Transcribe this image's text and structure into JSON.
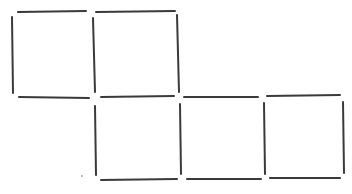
{
  "diagram": {
    "type": "matchstick-puzzle",
    "stick_color": "#3a3a3a",
    "stick_thickness": 2,
    "squares": [
      {
        "row": 0,
        "col": 0
      },
      {
        "row": 0,
        "col": 1
      },
      {
        "row": 1,
        "col": 1
      },
      {
        "row": 1,
        "col": 2
      },
      {
        "row": 1,
        "col": 3
      }
    ],
    "sticks": [
      {
        "id": "h-top-1",
        "x1": 18,
        "y1": 12,
        "x2": 86,
        "y2": 11
      },
      {
        "id": "h-top-2",
        "x1": 96,
        "y1": 12,
        "x2": 175,
        "y2": 11
      },
      {
        "id": "v-left-1",
        "x1": 12,
        "y1": 17,
        "x2": 13,
        "y2": 93
      },
      {
        "id": "v-mid-1",
        "x1": 93,
        "y1": 18,
        "x2": 95,
        "y2": 92
      },
      {
        "id": "v-right-2",
        "x1": 177,
        "y1": 15,
        "x2": 179,
        "y2": 92
      },
      {
        "id": "h-mid-1",
        "x1": 19,
        "y1": 97,
        "x2": 89,
        "y2": 98
      },
      {
        "id": "h-mid-2",
        "x1": 101,
        "y1": 97,
        "x2": 174,
        "y2": 96
      },
      {
        "id": "h-mid-3",
        "x1": 184,
        "y1": 97,
        "x2": 258,
        "y2": 97
      },
      {
        "id": "h-mid-4",
        "x1": 267,
        "y1": 96,
        "x2": 340,
        "y2": 95
      },
      {
        "id": "v-b-1",
        "x1": 95,
        "y1": 106,
        "x2": 96,
        "y2": 175
      },
      {
        "id": "v-b-2",
        "x1": 180,
        "y1": 104,
        "x2": 181,
        "y2": 174
      },
      {
        "id": "v-b-3",
        "x1": 264,
        "y1": 103,
        "x2": 265,
        "y2": 174
      },
      {
        "id": "v-b-4",
        "x1": 343,
        "y1": 102,
        "x2": 344,
        "y2": 173
      },
      {
        "id": "h-bot-1",
        "x1": 101,
        "y1": 180,
        "x2": 177,
        "y2": 179
      },
      {
        "id": "h-bot-2",
        "x1": 187,
        "y1": 179,
        "x2": 261,
        "y2": 179
      },
      {
        "id": "h-bot-3",
        "x1": 270,
        "y1": 178,
        "x2": 340,
        "y2": 178
      }
    ],
    "stray_marks": [
      {
        "x": 82,
        "y": 176
      }
    ]
  }
}
